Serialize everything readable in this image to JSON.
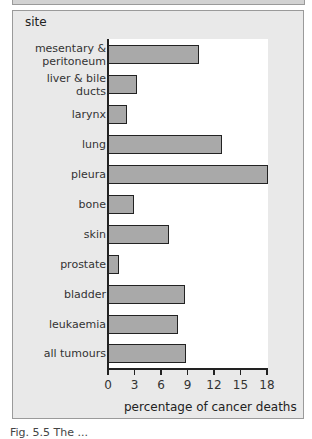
{
  "chart_data": {
    "type": "bar",
    "orientation": "horizontal",
    "title": "",
    "xlabel": "percentage of cancer deaths",
    "ylabel": "site",
    "xlim": [
      0,
      18
    ],
    "xticks": [
      0,
      3,
      6,
      9,
      12,
      15,
      18
    ],
    "grid": false,
    "legend": null,
    "categories": [
      "mesentary & peritoneum",
      "liver & bile ducts",
      "larynx",
      "lung",
      "pleura",
      "bone",
      "skin",
      "prostate",
      "bladder",
      "leukaemia",
      "all tumours"
    ],
    "values": [
      10.3,
      3.3,
      2.2,
      12.9,
      18.1,
      3.0,
      6.9,
      1.2,
      8.7,
      7.9,
      8.8
    ],
    "bar_color": "#a9a9a9",
    "bar_edge_color": "#222222"
  },
  "labels": {
    "y_title": "site",
    "x_title": "percentage of cancer deaths",
    "categories": [
      [
        "mesentary &",
        "peritoneum"
      ],
      [
        "liver & bile",
        "ducts"
      ],
      [
        "larynx"
      ],
      [
        "lung"
      ],
      [
        "pleura"
      ],
      [
        "bone"
      ],
      [
        "skin"
      ],
      [
        "prostate"
      ],
      [
        "bladder"
      ],
      [
        "leukaemia"
      ],
      [
        "all tumours"
      ]
    ],
    "ticks": [
      "0",
      "3",
      "6",
      "9",
      "12",
      "15",
      "18"
    ]
  },
  "caption": "Fig. 5.5  The ..."
}
